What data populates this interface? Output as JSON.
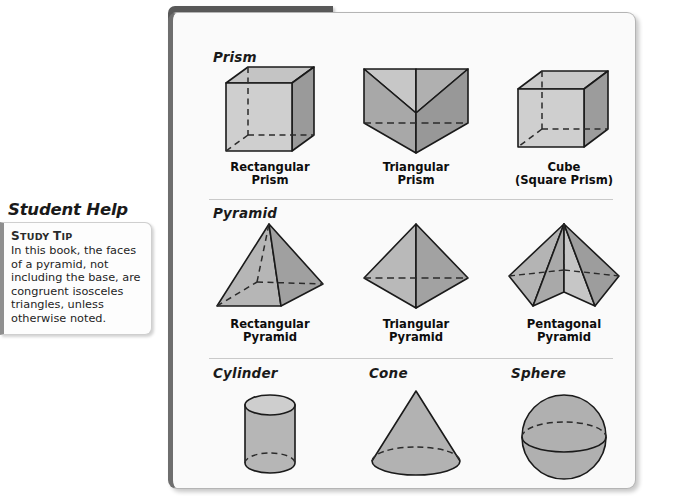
{
  "sidebar": {
    "title": "Student Help",
    "tip_label_small": "TUDY",
    "tip_label_first": "S",
    "tip_label_second": "T",
    "tip_label_rest": "IP",
    "tip_label_full": "STUDY TIP",
    "tip_body": "In this book, the faces of a pyramid, not including the base, are congruent isosceles triangles, unless otherwise noted."
  },
  "panel": {
    "header_title": "TYPES OF SOLIDS",
    "accent_color": "#595959",
    "background_color": "#fafafa",
    "border_color": "#b4b4b4"
  },
  "shape_colors": {
    "face_light": "#cfcfcf",
    "face_medium": "#b4b4b4",
    "face_dark": "#9a9a9a",
    "face_darker": "#8c8c8c",
    "outline": "#1a1a1a"
  },
  "sections": [
    {
      "label": "Prism",
      "figures": [
        {
          "name": "rectangular-prism",
          "caption_line1": "Rectangular",
          "caption_line2": "Prism"
        },
        {
          "name": "triangular-prism",
          "caption_line1": "Triangular",
          "caption_line2": "Prism"
        },
        {
          "name": "cube",
          "caption_line1": "Cube",
          "caption_line2": "(Square Prism)"
        }
      ]
    },
    {
      "label": "Pyramid",
      "figures": [
        {
          "name": "rectangular-pyramid",
          "caption_line1": "Rectangular",
          "caption_line2": "Pyramid"
        },
        {
          "name": "triangular-pyramid",
          "caption_line1": "Triangular",
          "caption_line2": "Pyramid"
        },
        {
          "name": "pentagonal-pyramid",
          "caption_line1": "Pentagonal",
          "caption_line2": "Pyramid"
        }
      ]
    },
    {
      "label_cylinder": "Cylinder",
      "label_cone": "Cone",
      "label_sphere": "Sphere"
    }
  ]
}
